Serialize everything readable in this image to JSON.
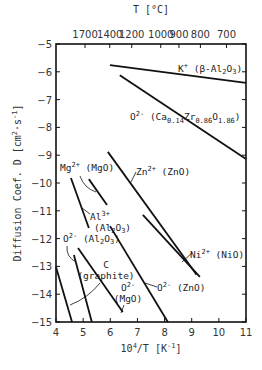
{
  "chart_data": {
    "type": "line",
    "title": "",
    "xlabel": "10^4/T [K^-1]",
    "ylabel": "Diffusion Coef. D [cm^2·s^-1]",
    "top_xlabel": "T [°C]",
    "xlim": [
      4,
      11
    ],
    "ylim": [
      -15,
      -5
    ],
    "grid": false,
    "x_ticks": [
      4,
      5,
      6,
      7,
      8,
      9,
      10,
      11
    ],
    "y_ticks": [
      -5,
      -6,
      -7,
      -8,
      -9,
      -10,
      -11,
      -12,
      -13,
      -14,
      -15
    ],
    "top_ticks": [
      {
        "label": "1700",
        "x": 5.07
      },
      {
        "label": "1400",
        "x": 5.98
      },
      {
        "label": "1200",
        "x": 6.79
      },
      {
        "label": "1000",
        "x": 7.86
      },
      {
        "label": "900",
        "x": 8.53
      },
      {
        "label": "800",
        "x": 9.32
      },
      {
        "label": "700",
        "x": 10.28
      }
    ],
    "series": [
      {
        "name": "K+ (β-Al2O3)",
        "x": [
          5.99,
          11.0
        ],
        "y": [
          -5.76,
          -6.4
        ]
      },
      {
        "name": "O2- (Ca0.14Zr0.86O1.86)",
        "x": [
          6.35,
          11.0
        ],
        "y": [
          -6.12,
          -9.14
        ]
      },
      {
        "name": "Zn2+ (ZnO)",
        "x": [
          5.91,
          9.18
        ],
        "y": [
          -8.88,
          -13.3
        ]
      },
      {
        "name": "Ni2+ (NiO)",
        "x": [
          7.2,
          9.3
        ],
        "y": [
          -11.15,
          -13.38
        ]
      },
      {
        "name": "O2- (ZnO)",
        "x": [
          5.99,
          8.12
        ],
        "y": [
          -11.55,
          -15.0
        ]
      },
      {
        "name": "O2- (MgO)",
        "x": [
          4.81,
          6.46
        ],
        "y": [
          -12.34,
          -14.64
        ]
      },
      {
        "name": "Mg2+ (MgO)",
        "x": [
          5.21,
          5.88
        ],
        "y": [
          -9.86,
          -10.79
        ]
      },
      {
        "name": "Al3+ (Al2O3)",
        "x": [
          4.55,
          5.21
        ],
        "y": [
          -9.82,
          -11.62
        ]
      },
      {
        "name": "O2- (Al2O3)",
        "x": [
          4.66,
          5.32
        ],
        "y": [
          -12.59,
          -15.0
        ]
      },
      {
        "name": "C (graphite)",
        "x": [
          4.0,
          4.59
        ],
        "y": [
          -13.02,
          -15.0
        ]
      }
    ]
  },
  "labels": {
    "top_title": "T [°C]",
    "x_title_base": "10",
    "x_title_exp": "4",
    "x_title_rest": "/T [K",
    "x_title_exp2": "-1",
    "x_title_end": "]",
    "y_title_main": "Diffusion Coef. D [cm",
    "y_title_exp": "2",
    "y_title_mid": "·s",
    "y_title_exp2": "-1",
    "y_title_end": "]",
    "k": {
      "ion": "K",
      "charge": "+",
      "host": " (β-Al",
      "sub1": "2",
      "o": "O",
      "sub2": "3",
      "end": ")"
    },
    "caz": {
      "ion": "O",
      "charge": "2-",
      "host": " (Ca",
      "s1": "0.14",
      "zr": "Zr",
      "s2": "0.86",
      "o": "O",
      "s3": "1.86",
      "end": ")"
    },
    "zn": {
      "ion": "Zn",
      "charge": "2+",
      "host": " (ZnO)"
    },
    "ni": {
      "ion": "Ni",
      "charge": "2+",
      "host": " (NiO)"
    },
    "ozno": {
      "ion": "O",
      "charge": "2-",
      "host": " (ZnO)"
    },
    "omgo": {
      "ion": "O",
      "charge": "2-",
      "host": "(MgO)"
    },
    "mg": {
      "ion": "Mg",
      "charge": "2+",
      "host": " (MgO)"
    },
    "al": {
      "ion": "Al",
      "charge": "3+",
      "host": "(Al",
      "sub1": "2",
      "o": "O",
      "sub2": "3",
      "end": ")"
    },
    "oal": {
      "ion": "O",
      "charge": "2-",
      "host": " (Al",
      "sub1": "2",
      "o": "O",
      "sub2": "3",
      "end": ")"
    },
    "c": {
      "line1": "C",
      "line2": "(graphite)"
    }
  }
}
